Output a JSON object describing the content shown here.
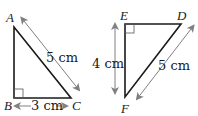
{
  "diagram": {
    "triangles": [
      {
        "name": "ABC",
        "vertices": {
          "A": "A",
          "B": "B",
          "C": "C"
        },
        "right_angle_at": "B",
        "measurements": {
          "hypotenuse_AC": "5 cm",
          "base_BC": "3 cm"
        }
      },
      {
        "name": "EDF",
        "vertices": {
          "E": "E",
          "D": "D",
          "F": "F"
        },
        "right_angle_at": "E",
        "measurements": {
          "side_EF": "4 cm",
          "hypotenuse_DF": "5 cm"
        }
      }
    ],
    "colors": {
      "line": "#1a1a1a",
      "arrow": "#808080"
    }
  }
}
